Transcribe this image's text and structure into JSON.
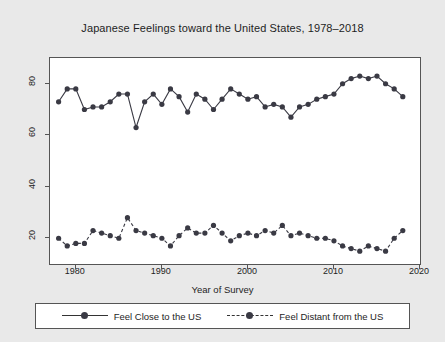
{
  "chart_data": {
    "type": "line",
    "title": "Japanese Feelings toward the United States, 1978–2018",
    "xlabel": "Year of Survey",
    "ylabel": "Percent of Respondents",
    "xlim": [
      1977,
      2020
    ],
    "ylim": [
      10,
      90
    ],
    "xticks": [
      1980,
      1990,
      2000,
      2010,
      2020
    ],
    "yticks": [
      20,
      40,
      60,
      80
    ],
    "grid": false,
    "legend_position": "below",
    "series": [
      {
        "name": "Feel Close to the US",
        "style": "solid",
        "marker": "circle",
        "color": "#3a3a44",
        "x": [
          1978,
          1979,
          1980,
          1981,
          1982,
          1983,
          1984,
          1985,
          1986,
          1987,
          1988,
          1989,
          1990,
          1991,
          1992,
          1993,
          1994,
          1995,
          1996,
          1997,
          1998,
          1999,
          2000,
          2001,
          2002,
          2003,
          2004,
          2005,
          2006,
          2007,
          2008,
          2009,
          2010,
          2011,
          2012,
          2013,
          2014,
          2015,
          2016,
          2017,
          2018
        ],
        "values": [
          73,
          78,
          78,
          70,
          71,
          71,
          73,
          76,
          76,
          63,
          73,
          76,
          72,
          78,
          75,
          69,
          76,
          74,
          70,
          74,
          78,
          76,
          74,
          75,
          71,
          72,
          71,
          67,
          71,
          72,
          74,
          75,
          76,
          80,
          82,
          83,
          82,
          83,
          80,
          78,
          75
        ]
      },
      {
        "name": "Feel Distant from the US",
        "style": "dashed",
        "marker": "circle",
        "color": "#3a3a44",
        "x": [
          1978,
          1979,
          1980,
          1981,
          1982,
          1983,
          1984,
          1985,
          1986,
          1987,
          1988,
          1989,
          1990,
          1991,
          1992,
          1993,
          1994,
          1995,
          1996,
          1997,
          1998,
          1999,
          2000,
          2001,
          2002,
          2003,
          2004,
          2005,
          2006,
          2007,
          2008,
          2009,
          2010,
          2011,
          2012,
          2013,
          2014,
          2015,
          2016,
          2017,
          2018
        ],
        "values": [
          20,
          17,
          18,
          18,
          23,
          22,
          21,
          20,
          28,
          23,
          22,
          21,
          20,
          17,
          21,
          24,
          22,
          22,
          25,
          22,
          19,
          21,
          22,
          21,
          23,
          22,
          25,
          21,
          22,
          21,
          20,
          20,
          19,
          17,
          16,
          15,
          17,
          16,
          15,
          20,
          23
        ]
      }
    ]
  }
}
